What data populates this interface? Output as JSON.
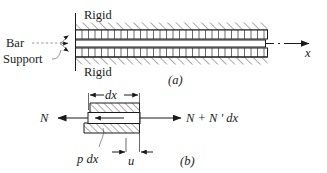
{
  "figure": {
    "title_a": "(a)",
    "title_b": "(b)",
    "labels": {
      "rigid_top": "Rigid",
      "rigid_bottom": "Rigid",
      "bar": "Bar",
      "support": "Support",
      "axis_x": "x",
      "dx": "dx",
      "force_left": "N",
      "force_right": "N + N ' dx",
      "distributed_load": "p dx",
      "displacement": "u"
    },
    "colors": {
      "ink": "#1a1a1a",
      "hatch": "#2b2b2b",
      "background": "#ffffff"
    }
  }
}
